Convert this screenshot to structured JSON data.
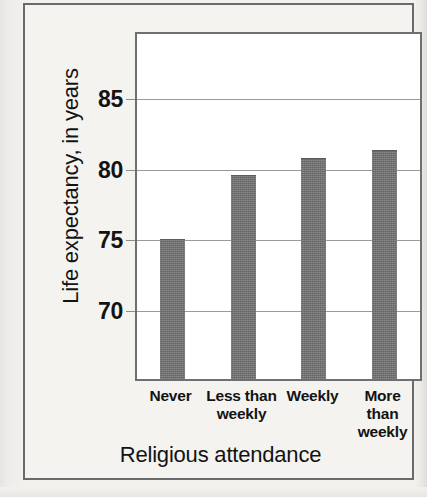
{
  "chart_data": {
    "type": "bar",
    "title": "",
    "subtitle": "",
    "xlabel": "Religious attendance",
    "ylabel": "Life expectancy, in years",
    "categories": [
      "Never",
      "Less than\nweekly",
      "Weekly",
      "More than\nweekly"
    ],
    "category_lines": [
      [
        "Never"
      ],
      [
        "Less than",
        "weekly"
      ],
      [
        "Weekly"
      ],
      [
        "More than",
        "weekly"
      ]
    ],
    "values": [
      75.1,
      79.6,
      80.8,
      81.4
    ],
    "ylim": [
      65.2,
      89.6
    ],
    "yticks": [
      70,
      75,
      80,
      85
    ],
    "ytick_labels": [
      "70",
      "75",
      "80",
      "85"
    ],
    "grid": "horizontal",
    "legend": "none",
    "bar_color": "#6e6e6e",
    "plot_background": "#ffffff",
    "gridline_color": "#9a9a9a",
    "frame_color": "#6f6f6f",
    "page_background": "#f2f1ee",
    "text_color": "#131313"
  }
}
